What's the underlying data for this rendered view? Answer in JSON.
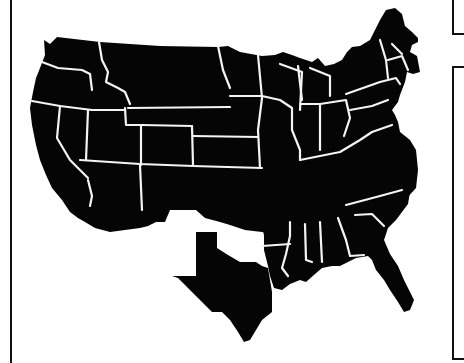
{
  "map": {
    "subject": "Contiguous United States silhouette",
    "style": "black fill with white state borders",
    "colors": {
      "land": "#050505",
      "borders": "#f4f4f4",
      "background": "#ffffff",
      "frame": "#111111"
    },
    "regions": [
      {
        "name": "main-northern-block",
        "description": "West, Mountain, Plains, Midwest and Northeast states"
      },
      {
        "name": "texas",
        "description": "Texas shown detached"
      },
      {
        "name": "southeast-block",
        "description": "Arkansas, Louisiana, Deep South, Carolinas and Florida"
      }
    ],
    "gap": "white gap separating Oklahoma/New Mexico area from Texas and the southern block"
  },
  "frame": {
    "left_line": true,
    "right_brackets": 2
  }
}
